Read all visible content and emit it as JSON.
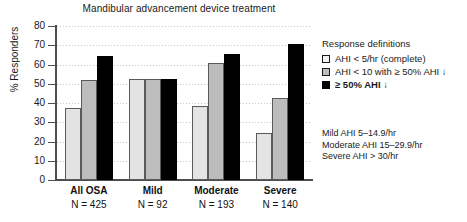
{
  "chart_data": {
    "type": "bar",
    "title": "Mandibular advancement device treatment",
    "xlabel": "",
    "ylabel": "% Responders",
    "ylim": [
      0,
      80
    ],
    "ytick_step": 10,
    "yticks": [
      80,
      70,
      60,
      50,
      40,
      30,
      20,
      10,
      0
    ],
    "grid": true,
    "legend_position": "right",
    "categories": [
      "All OSA",
      "Mild",
      "Moderate",
      "Severe"
    ],
    "category_counts": [
      "N = 425",
      "N = 92",
      "N = 193",
      "N = 140"
    ],
    "series": [
      {
        "name": "AHI < 5/hr (complete)",
        "color": "#e3e3e3",
        "values": [
          37.5,
          52.5,
          38.5,
          24.5
        ]
      },
      {
        "name": "AHI < 10 with ≥ 50% AHI ↓",
        "color": "#bdbdbd",
        "values": [
          52.0,
          52.5,
          61.0,
          42.5
        ]
      },
      {
        "name": "≥ 50% AHI ↓",
        "color": "#000000",
        "values": [
          64.5,
          52.5,
          65.5,
          70.5
        ]
      }
    ]
  },
  "legend": {
    "title": "Response definitions",
    "items": [
      {
        "label": "AHI < 5/hr (complete)",
        "swatch": "light-gray-swatch-icon"
      },
      {
        "label": "AHI < 10 with ≥ 50% AHI ↓",
        "swatch": "medium-gray-swatch-icon"
      },
      {
        "label": "≥ 50% AHI ↓",
        "swatch": "black-swatch-icon"
      }
    ]
  },
  "notes": {
    "lines": [
      "Mild AHI 5–14.9/hr",
      "Moderate AHI 15–29.9/hr",
      "Severe AHI > 30/hr"
    ]
  }
}
